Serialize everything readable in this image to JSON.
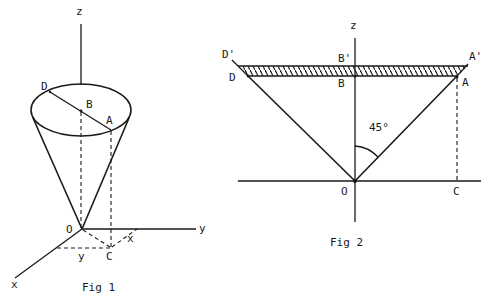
{
  "colors": {
    "ink": "#1a1a1a",
    "background": "#ffffff"
  },
  "fig1": {
    "caption": "Fig 1",
    "labels": {
      "z": "z",
      "y_axis": "y",
      "x_axis": "x",
      "D": "D",
      "B": "B",
      "A": "A",
      "O": "O",
      "C": "C",
      "x_proj": "x",
      "y_proj": "y"
    }
  },
  "fig2": {
    "caption": "Fig 2",
    "angle": "45°",
    "labels": {
      "z": "z",
      "D_prime": "D'",
      "D": "D",
      "B_prime": "B'",
      "B": "B",
      "A_prime": "A'",
      "A": "A",
      "O": "O",
      "C": "C"
    }
  }
}
